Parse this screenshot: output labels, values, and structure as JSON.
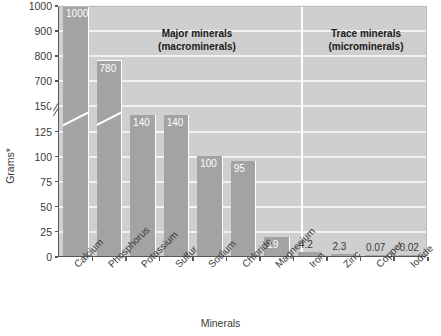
{
  "chart_data": {
    "type": "bar",
    "title": "",
    "xlabel": "Minerals",
    "ylabel": "Grams*",
    "categories": [
      "Calcium",
      "Phosphorus",
      "Potassium",
      "Sulfur",
      "Sodium",
      "Chloride",
      "Magnesium",
      "Iron",
      "Zinc",
      "Copper",
      "Iodide"
    ],
    "values": [
      1000,
      780,
      140,
      140,
      100,
      95,
      19,
      4.2,
      2.3,
      0.07,
      0.02
    ],
    "value_labels": [
      "1000",
      "780",
      "140",
      "140",
      "100",
      "95",
      "19",
      "4.2",
      "2.3",
      "0.07",
      "0.02"
    ],
    "yticks": [
      0,
      25,
      50,
      75,
      100,
      125,
      150,
      700,
      800,
      900,
      1000
    ],
    "ytick_labels": [
      "0",
      "25",
      "50",
      "75",
      "100",
      "125",
      "150",
      "700",
      "800",
      "900",
      "1000"
    ],
    "ylim": [
      0,
      1000
    ],
    "axis_break": {
      "present": true,
      "between": [
        150,
        700
      ],
      "note": "broken y-axis between 150 and 700"
    },
    "grid": true,
    "grid_orientation": "horizontal",
    "legend": "none",
    "annotations": [
      {
        "text": "Major minerals",
        "subtext": "(macrominerals)",
        "covers": [
          "Calcium",
          "Phosphorus",
          "Potassium",
          "Sulfur",
          "Sodium",
          "Chloride",
          "Magnesium"
        ]
      },
      {
        "text": "Trace minerals",
        "subtext": "(microminerals)",
        "covers": [
          "Iron",
          "Zinc",
          "Copper",
          "Iodide"
        ]
      }
    ],
    "colors": {
      "bar": "#a3a3a3",
      "plot_background": "#cfcfcf",
      "gridline": "#f2f2f2",
      "axis": "#58585a",
      "value_label_inside": "#ffffff",
      "value_label_outside": "#3a3a3a",
      "tick_text": "#3a3a3a",
      "section_title": "#1a1a1a",
      "page_background": "#ffffff"
    }
  },
  "sections": {
    "major": {
      "line1": "Major minerals",
      "line2": "(macrominerals)"
    },
    "trace": {
      "line1": "Trace minerals",
      "line2": "(microminerals)"
    }
  },
  "axes": {
    "y_title": "Grams*",
    "x_title": "Minerals"
  }
}
